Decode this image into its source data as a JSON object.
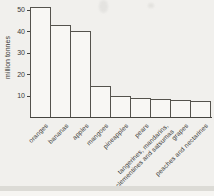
{
  "chart_data": {
    "type": "bar",
    "title": "",
    "xlabel": "",
    "ylabel": "million tonnes",
    "categories": [
      "oranges",
      "bananas",
      "apples",
      "mangoes",
      "pineapples",
      "pears",
      "tangerines, mandarins,\nclementines and satsumas",
      "grapes",
      "peaches and nectarines"
    ],
    "values": [
      51,
      43,
      40,
      14.5,
      10,
      9,
      8.5,
      8,
      7.5
    ],
    "unit": "million tonnes",
    "ylim": [
      0,
      52
    ],
    "yticks": [
      10,
      20,
      30,
      40,
      50
    ],
    "grid": false,
    "legend": null,
    "bar_fill": "#f8f7f4",
    "bar_border": "#55534d",
    "axis_color": "#45443f",
    "text_color": "#3b3a37",
    "background": "#f1f0ed"
  }
}
